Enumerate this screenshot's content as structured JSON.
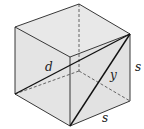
{
  "diagram": {
    "type": "cube-diagonals",
    "labels": {
      "d": "d",
      "y": "y",
      "s_right": "s",
      "s_bottom": "s"
    },
    "colors": {
      "face_fill": "#e6e6e6",
      "edge": "#222222",
      "hidden_edge": "#444444",
      "background": "#ffffff"
    }
  }
}
